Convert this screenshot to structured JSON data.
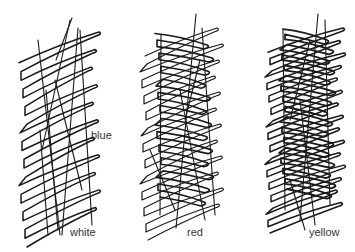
{
  "figure": {
    "background": "#ffffff",
    "ink_color": "#1a1a1a",
    "label_color": "#333333",
    "scribbles": [
      {
        "name": "scribble-left",
        "density": "sparse",
        "labels": [
          {
            "text": "blue",
            "x": 91,
            "y": 130
          },
          {
            "text": "white",
            "x": 70,
            "y": 227
          }
        ],
        "loops": {
          "x_left": 22,
          "x_right": 95,
          "y_top": 32,
          "y_bottom": 225,
          "count": 11,
          "slant": 22,
          "stroke": 1.5
        },
        "lines": [
          [
            38,
            40,
            60,
            235
          ],
          [
            46,
            90,
            58,
            230
          ],
          [
            70,
            20,
            42,
            150
          ],
          [
            72,
            18,
            56,
            60
          ],
          [
            78,
            28,
            62,
            235
          ],
          [
            80,
            30,
            92,
            225
          ],
          [
            55,
            80,
            82,
            190
          ],
          [
            40,
            130,
            48,
            235
          ]
        ]
      },
      {
        "name": "scribble-middle",
        "density": "medium",
        "labels": [
          {
            "text": "red",
            "x": 187,
            "y": 227
          }
        ],
        "loops": {
          "x_left": 143,
          "x_right": 218,
          "y_top": 28,
          "y_bottom": 220,
          "count": 12,
          "slant": 20,
          "stroke": 1.2
        },
        "cross": {
          "x_left": 158,
          "x_right": 208,
          "y_top": 45,
          "y_bottom": 215,
          "count": 13,
          "slant": -18,
          "stroke": 1.6
        },
        "lines": [
          [
            161,
            35,
            160,
            215
          ],
          [
            196,
            14,
            176,
            228
          ],
          [
            202,
            28,
            215,
            215
          ],
          [
            180,
            90,
            205,
            220
          ],
          [
            150,
            150,
            175,
            210
          ],
          [
            200,
            60,
            185,
            120
          ]
        ]
      },
      {
        "name": "scribble-right",
        "density": "dense",
        "labels": [
          {
            "text": "yellow",
            "x": 309,
            "y": 227
          }
        ],
        "loops": {
          "x_left": 268,
          "x_right": 340,
          "y_top": 28,
          "y_bottom": 215,
          "count": 15,
          "slant": 18,
          "stroke": 1.5
        },
        "cross": {
          "x_left": 282,
          "x_right": 330,
          "y_top": 40,
          "y_bottom": 205,
          "count": 16,
          "slant": -16,
          "stroke": 1.8
        },
        "lines": [
          [
            283,
            30,
            285,
            210
          ],
          [
            318,
            14,
            300,
            220
          ],
          [
            325,
            20,
            330,
            205
          ],
          [
            300,
            100,
            315,
            225
          ],
          [
            290,
            180,
            305,
            230
          ],
          [
            310,
            40,
            290,
            120
          ]
        ]
      }
    ]
  }
}
